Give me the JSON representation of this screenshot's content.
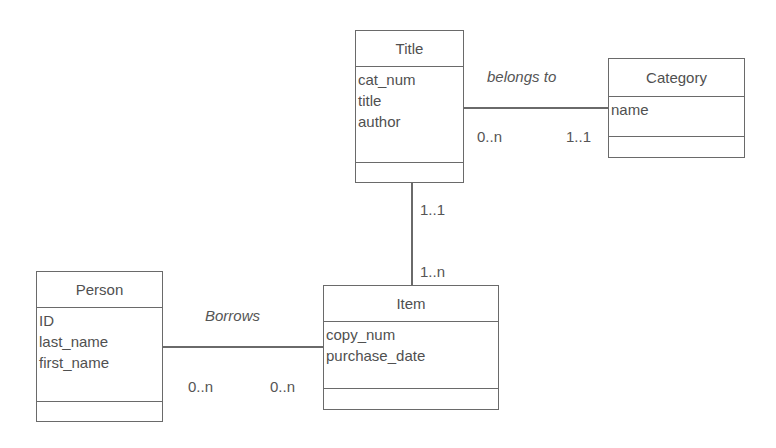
{
  "diagram": {
    "type": "UML class diagram",
    "classes": [
      {
        "id": "title",
        "name": "Title",
        "attributes": [
          "cat_num",
          "title",
          "author"
        ],
        "operations": []
      },
      {
        "id": "category",
        "name": "Category",
        "attributes": [
          "name"
        ],
        "operations": []
      },
      {
        "id": "person",
        "name": "Person",
        "attributes": [
          "ID",
          "last_name",
          "first_name"
        ],
        "operations": []
      },
      {
        "id": "item",
        "name": "Item",
        "attributes": [
          "copy_num",
          "purchase_date"
        ],
        "operations": []
      }
    ],
    "associations": [
      {
        "id": "belongs_to",
        "name": "belongs to",
        "from": "Title",
        "to": "Category",
        "from_multiplicity": "0..n",
        "to_multiplicity": "1..1"
      },
      {
        "id": "title_item",
        "name": "",
        "from": "Title",
        "to": "Item",
        "from_multiplicity": "1..1",
        "to_multiplicity": "1..n"
      },
      {
        "id": "borrows",
        "name": "Borrows",
        "from": "Person",
        "to": "Item",
        "from_multiplicity": "0..n",
        "to_multiplicity": "0..n"
      }
    ]
  },
  "colors": {
    "line": "#6a6a6a",
    "text": "#505050",
    "background": "#ffffff"
  }
}
